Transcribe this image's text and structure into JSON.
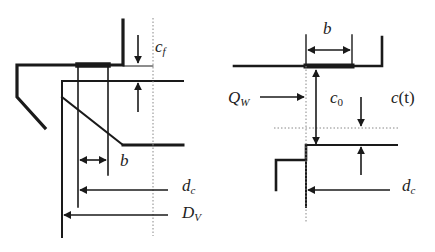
{
  "diagram": {
    "left_figure": {
      "labels": {
        "cf": {
          "main": "c",
          "sub": "f"
        },
        "b": {
          "main": "b"
        },
        "dc": {
          "main": "d",
          "sub": "c"
        },
        "Dv": {
          "main": "D",
          "sub": "V"
        }
      }
    },
    "right_figure": {
      "labels": {
        "b": {
          "main": "b"
        },
        "Qw": {
          "main": "Q",
          "sub": "W"
        },
        "c0": {
          "main": "c",
          "sub": "0"
        },
        "ct": {
          "main": "c",
          "arg": "(t)"
        },
        "dc": {
          "main": "d",
          "sub": "c"
        }
      }
    },
    "colors": {
      "line": "#1a1a1a",
      "dotted": "#888888",
      "text": "#222222"
    }
  }
}
